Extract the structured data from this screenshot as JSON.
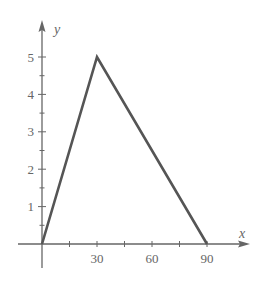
{
  "chart_data": {
    "type": "line",
    "title": "",
    "xlabel": "x",
    "ylabel": "y",
    "x": [
      0,
      30,
      90
    ],
    "series": [
      {
        "name": "piecewise",
        "values": [
          0,
          5,
          0
        ]
      }
    ],
    "xlim": [
      -5,
      100
    ],
    "ylim": [
      -1.5,
      6
    ],
    "x_ticks": [
      15,
      30,
      45,
      60,
      75,
      90
    ],
    "x_tick_labels": [
      "",
      "30",
      "",
      "60",
      "",
      "90"
    ],
    "y_ticks": [
      0.5,
      1,
      1.5,
      2,
      2.5,
      3,
      3.5,
      4,
      4.5,
      5
    ],
    "y_tick_labels": [
      "",
      "1",
      "",
      "2",
      "",
      "3",
      "",
      "4",
      "",
      "5"
    ],
    "grid": false,
    "legend": null,
    "colors": {
      "line": "#555555",
      "axis": "#666666"
    }
  }
}
